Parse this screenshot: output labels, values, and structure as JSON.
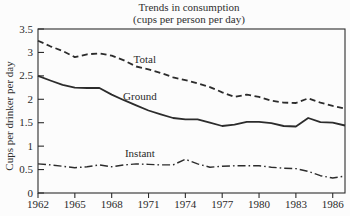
{
  "chart_data": {
    "type": "line",
    "title": "Trends in consumption",
    "subtitle": "(cups per person per day)",
    "ylabel": "Cups per drinker per day",
    "xlabel": "",
    "x": [
      1962,
      1963,
      1964,
      1965,
      1966,
      1967,
      1968,
      1969,
      1970,
      1971,
      1972,
      1973,
      1974,
      1975,
      1976,
      1977,
      1978,
      1979,
      1980,
      1981,
      1982,
      1983,
      1984,
      1985,
      1986,
      1987
    ],
    "xlim": [
      1962,
      1987
    ],
    "ylim": [
      0,
      3.5
    ],
    "x_ticks": [
      1962,
      1965,
      1968,
      1971,
      1974,
      1977,
      1980,
      1983,
      1986
    ],
    "x_tick_labels": [
      "1962",
      "1965",
      "1968",
      "1971",
      "1974",
      "1977",
      "1980",
      "1983",
      "1986"
    ],
    "y_ticks": [
      0,
      0.5,
      1,
      1.5,
      2,
      2.5,
      3,
      3.5
    ],
    "y_tick_labels": [
      "0",
      "0.5",
      "1",
      "1.5",
      "2",
      "2.5",
      "3",
      "3.5"
    ],
    "grid": false,
    "frame": "full-box",
    "legend_position": "inline-labels",
    "ink_color": "#2c2c2c",
    "background_color": "#fcfcfc",
    "series": [
      {
        "name": "Total",
        "line_style": "dashed",
        "label_pos": {
          "x": 1970.7,
          "y": 2.77
        },
        "values": [
          3.25,
          3.13,
          3.03,
          2.9,
          2.96,
          2.98,
          2.93,
          2.83,
          2.7,
          2.64,
          2.56,
          2.47,
          2.41,
          2.34,
          2.26,
          2.15,
          2.05,
          2.1,
          2.05,
          1.97,
          1.93,
          1.92,
          2.02,
          1.93,
          1.86,
          1.8
        ]
      },
      {
        "name": "Ground",
        "line_style": "solid",
        "label_pos": {
          "x": 1970.3,
          "y": 1.98
        },
        "values": [
          2.5,
          2.4,
          2.31,
          2.25,
          2.24,
          2.24,
          2.1,
          1.98,
          1.87,
          1.76,
          1.68,
          1.6,
          1.57,
          1.57,
          1.5,
          1.43,
          1.46,
          1.52,
          1.52,
          1.49,
          1.43,
          1.42,
          1.6,
          1.51,
          1.5,
          1.44
        ]
      },
      {
        "name": "Instant",
        "line_style": "dash-dot",
        "label_pos": {
          "x": 1970.3,
          "y": 0.77
        },
        "values": [
          0.62,
          0.6,
          0.57,
          0.54,
          0.56,
          0.6,
          0.56,
          0.6,
          0.62,
          0.61,
          0.6,
          0.6,
          0.72,
          0.62,
          0.55,
          0.57,
          0.58,
          0.58,
          0.58,
          0.55,
          0.53,
          0.52,
          0.46,
          0.37,
          0.32,
          0.36
        ]
      }
    ]
  }
}
